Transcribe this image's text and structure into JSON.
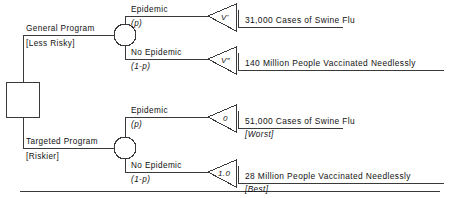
{
  "diagram": {
    "type": "decision-tree",
    "root": {
      "shape": "square",
      "label": ""
    },
    "branches": [
      {
        "name": "General Program",
        "note": "[Less Risky]",
        "chance_node": "circle",
        "outcomes": [
          {
            "event": "Epidemic",
            "probability": "(p)",
            "node_value": "V'",
            "text": "31,000 Cases of Swine Flu",
            "note": ""
          },
          {
            "event": "No Epidemic",
            "probability": "(1-p)",
            "node_value": "V″",
            "text": "140 Million People Vaccinated Needlessly",
            "note": ""
          }
        ]
      },
      {
        "name": "Targeted Program",
        "note": "[Riskier]",
        "chance_node": "circle",
        "outcomes": [
          {
            "event": "Epidemic",
            "probability": "(p)",
            "node_value": "0",
            "text": "51,000 Cases of Swine Flu",
            "note": "[Worst]"
          },
          {
            "event": "No Epidemic",
            "probability": "(1-p)",
            "node_value": "1.0",
            "text": "28 Million People Vaccinated Needlessly",
            "note": "[Best]"
          }
        ]
      }
    ],
    "colors": {
      "line": "#3a3a3a",
      "text": "#111111"
    }
  }
}
